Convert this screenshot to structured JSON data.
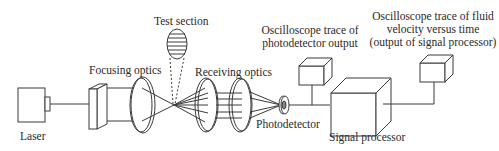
{
  "diagram": {
    "labels": {
      "laser": "Laser",
      "focusing_optics": "Focusing optics",
      "test_section": "Test section",
      "receiving_optics": "Receiving optics",
      "photodetector": "Photodetector",
      "scope1_line1": "Oscilloscope trace of",
      "scope1_line2": "photodetector output",
      "scope2_line1": "Oscilloscope trace of fluid",
      "scope2_line2": "velocity versus time",
      "scope2_line3": "(output of signal processor)",
      "signal_processor": "Signal processor"
    },
    "components": [
      {
        "id": "laser",
        "shape": "box"
      },
      {
        "id": "focusing-optics",
        "shape": "beam-splitter + lens"
      },
      {
        "id": "test-section",
        "shape": "striped-ellipse"
      },
      {
        "id": "receiving-optics",
        "shape": "two lenses"
      },
      {
        "id": "photodetector",
        "shape": "disc"
      },
      {
        "id": "oscilloscope-1",
        "shape": "cube"
      },
      {
        "id": "signal-processor",
        "shape": "cube"
      },
      {
        "id": "oscilloscope-2",
        "shape": "cube"
      }
    ],
    "colors": {
      "stroke": "#3a3a3a",
      "background": "#ffffff"
    }
  }
}
